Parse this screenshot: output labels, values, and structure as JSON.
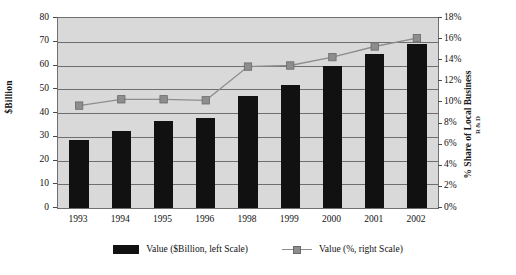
{
  "chart_data": {
    "type": "bar",
    "title": "",
    "subtitle": "",
    "categories": [
      "1993",
      "1994",
      "1995",
      "1996",
      "1998",
      "1999",
      "2000",
      "2001",
      "2002"
    ],
    "xlabel": "",
    "ylabel": "$Billion",
    "y2label": "% Share of Local Business",
    "y2label_line2": "R&D",
    "ylim": [
      0,
      80
    ],
    "y2lim": [
      0,
      18
    ],
    "yticks": [
      "0",
      "10",
      "20",
      "30",
      "40",
      "50",
      "60",
      "70",
      "80"
    ],
    "y2ticks": [
      "0%",
      "2%",
      "4%",
      "6%",
      "8%",
      "10%",
      "12%",
      "14%",
      "16%",
      "18%"
    ],
    "grid": true,
    "legend_position": "bottom-center",
    "plot_background": "#d9d9d9",
    "bar_color": "#111111",
    "line_color": "#8d8d8d",
    "marker_color": "#8d8d8d",
    "series": [
      {
        "name": "Value ($Billion, left Scale)",
        "type": "bar",
        "axis": "left",
        "values": [
          28.5,
          32.5,
          36.5,
          38.0,
          47.0,
          52.0,
          60.0,
          65.0,
          69.0
        ]
      },
      {
        "name": "Value (%, right Scale)",
        "type": "line",
        "axis": "right",
        "values": [
          9.7,
          10.3,
          10.3,
          10.2,
          13.4,
          13.5,
          14.3,
          15.3,
          16.1
        ]
      }
    ],
    "legend": [
      {
        "label": "Value ($Billion, left Scale)",
        "marker": "bar-swatch",
        "color": "#111111"
      },
      {
        "label": "Value (%, right Scale)",
        "marker": "line-square-marker",
        "color": "#8d8d8d"
      }
    ]
  }
}
